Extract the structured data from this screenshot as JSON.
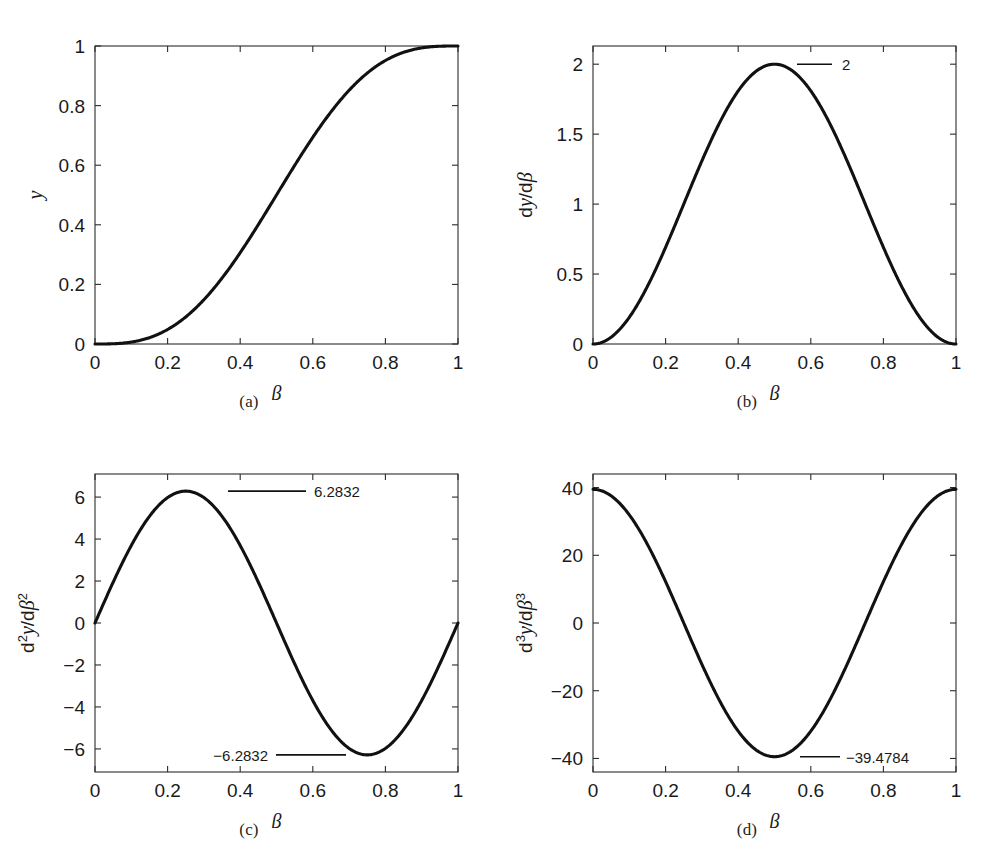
{
  "figure": {
    "panels": [
      {
        "caption": "(a)",
        "ylabel": "y",
        "ylabel_parts": {
          "base": "y",
          "sup": ""
        },
        "xlabel": "β",
        "xticks": [
          "0",
          "0.2",
          "0.4",
          "0.6",
          "0.8",
          "1"
        ],
        "yticks": [
          "0",
          "0.2",
          "0.4",
          "0.6",
          "0.8",
          "1"
        ],
        "annotations": []
      },
      {
        "caption": "(b)",
        "ylabel": "dy/dβ",
        "xlabel": "β",
        "xticks": [
          "0",
          "0.2",
          "0.4",
          "0.6",
          "0.8",
          "1"
        ],
        "yticks": [
          "0",
          "0.5",
          "1",
          "1.5",
          "2"
        ],
        "annotations": [
          {
            "label": "2",
            "value": 2,
            "at_x": 0.5,
            "text_side": "right"
          }
        ]
      },
      {
        "caption": "(c)",
        "ylabel": "d2y/dβ2",
        "xlabel": "β",
        "xticks": [
          "0",
          "0.2",
          "0.4",
          "0.6",
          "0.8",
          "1"
        ],
        "yticks": [
          "-6",
          "-4",
          "-2",
          "0",
          "2",
          "4",
          "6"
        ],
        "annotations": [
          {
            "label": "6.2832",
            "value": 6.2832,
            "at_x": 0.25,
            "text_side": "right"
          },
          {
            "label": "−6.2832",
            "value": -6.2832,
            "at_x": 0.75,
            "text_side": "left"
          }
        ]
      },
      {
        "caption": "(d)",
        "ylabel": "d3y/dβ3",
        "xlabel": "β",
        "xticks": [
          "0",
          "0.2",
          "0.4",
          "0.6",
          "0.8",
          "1"
        ],
        "yticks": [
          "-40",
          "-20",
          "0",
          "20",
          "40"
        ],
        "annotations": [
          {
            "label": "−39.4784",
            "value": -39.4784,
            "at_x": 0.5,
            "text_side": "right"
          }
        ]
      }
    ]
  },
  "chart_data": [
    {
      "type": "line",
      "panel": "(a)",
      "title": "",
      "xlabel": "β",
      "ylabel": "y",
      "xlim": [
        0,
        1
      ],
      "ylim": [
        0,
        1
      ],
      "xticks": [
        0,
        0.2,
        0.4,
        0.6,
        0.8,
        1
      ],
      "yticks": [
        0,
        0.2,
        0.4,
        0.6,
        0.8,
        1
      ],
      "grid": false,
      "legend": null,
      "function": "y = beta - sin(2*pi*beta)/(2*pi)",
      "x": [
        0,
        0.05,
        0.1,
        0.15,
        0.2,
        0.25,
        0.3,
        0.35,
        0.4,
        0.45,
        0.5,
        0.55,
        0.6,
        0.65,
        0.7,
        0.75,
        0.8,
        0.85,
        0.9,
        0.95,
        1
      ],
      "values": [
        0,
        0.0026,
        0.0202,
        0.0654,
        0.1427,
        0.25,
        0.3784,
        0.5145,
        0.6439,
        0.7546,
        0.84,
        0.8976,
        0.9288,
        0.9381,
        0.9323,
        0.9189,
        0.9054,
        0.8974,
        0.898,
        0.9081,
        1.0
      ]
    },
    {
      "type": "line",
      "panel": "(b)",
      "title": "",
      "xlabel": "β",
      "ylabel": "dy/dβ",
      "xlim": [
        0,
        1
      ],
      "ylim": [
        0,
        2.13
      ],
      "xticks": [
        0,
        0.2,
        0.4,
        0.6,
        0.8,
        1
      ],
      "yticks": [
        0,
        0.5,
        1,
        1.5,
        2
      ],
      "grid": false,
      "function": "dy/dbeta = 1 - cos(2*pi*beta)",
      "annotations": [
        {
          "label": "2",
          "value": 2,
          "at_x": 0.5
        }
      ],
      "x": [
        0,
        0.05,
        0.1,
        0.15,
        0.2,
        0.25,
        0.3,
        0.35,
        0.4,
        0.45,
        0.5,
        0.55,
        0.6,
        0.65,
        0.7,
        0.75,
        0.8,
        0.85,
        0.9,
        0.95,
        1
      ],
      "values": [
        0,
        0.0489,
        0.191,
        0.4122,
        0.691,
        1.0,
        1.309,
        1.5878,
        1.809,
        1.9511,
        2.0,
        1.9511,
        1.809,
        1.5878,
        1.309,
        1.0,
        0.691,
        0.4122,
        0.191,
        0.0489,
        0
      ]
    },
    {
      "type": "line",
      "panel": "(c)",
      "title": "",
      "xlabel": "β",
      "ylabel": "d²y/dβ²",
      "xlim": [
        0,
        1
      ],
      "ylim": [
        -7.1,
        7.1
      ],
      "xticks": [
        0,
        0.2,
        0.4,
        0.6,
        0.8,
        1
      ],
      "yticks": [
        -6,
        -4,
        -2,
        0,
        2,
        4,
        6
      ],
      "grid": false,
      "function": "d2y/dbeta2 = 2*pi*sin(2*pi*beta)",
      "annotations": [
        {
          "label": "6.2832",
          "value": 6.2832,
          "at_x": 0.25
        },
        {
          "label": "−6.2832",
          "value": -6.2832,
          "at_x": 0.75
        }
      ],
      "x": [
        0,
        0.05,
        0.1,
        0.15,
        0.2,
        0.25,
        0.3,
        0.35,
        0.4,
        0.45,
        0.5,
        0.55,
        0.6,
        0.65,
        0.7,
        0.75,
        0.8,
        0.85,
        0.9,
        0.95,
        1
      ],
      "values": [
        0,
        1.9416,
        3.6932,
        5.0832,
        5.9757,
        6.2832,
        5.9757,
        5.0832,
        3.6932,
        1.9416,
        0,
        -1.9416,
        -3.6932,
        -5.0832,
        -5.9757,
        -6.2832,
        -5.9757,
        -5.0832,
        -3.6932,
        -1.9416,
        0
      ]
    },
    {
      "type": "line",
      "panel": "(d)",
      "title": "",
      "xlabel": "β",
      "ylabel": "d³y/dβ³",
      "xlim": [
        0,
        1
      ],
      "ylim": [
        -44,
        44
      ],
      "xticks": [
        0,
        0.2,
        0.4,
        0.6,
        0.8,
        1
      ],
      "yticks": [
        -40,
        -20,
        0,
        20,
        40
      ],
      "grid": false,
      "function": "d3y/dbeta3 = 4*pi^2*cos(2*pi*beta)",
      "annotations": [
        {
          "label": "−39.4784",
          "value": -39.4784,
          "at_x": 0.5
        }
      ],
      "x": [
        0,
        0.05,
        0.1,
        0.15,
        0.2,
        0.25,
        0.3,
        0.35,
        0.4,
        0.45,
        0.5,
        0.55,
        0.6,
        0.65,
        0.7,
        0.75,
        0.8,
        0.85,
        0.9,
        0.95,
        1
      ],
      "values": [
        39.4784,
        37.57,
        31.9368,
        23.2062,
        12.2005,
        0,
        -12.2005,
        -23.2062,
        -31.9368,
        -37.57,
        -39.4784,
        -37.57,
        -31.9368,
        -23.2062,
        -12.2005,
        0,
        12.2005,
        23.2062,
        31.9368,
        37.57,
        39.4784
      ]
    }
  ]
}
